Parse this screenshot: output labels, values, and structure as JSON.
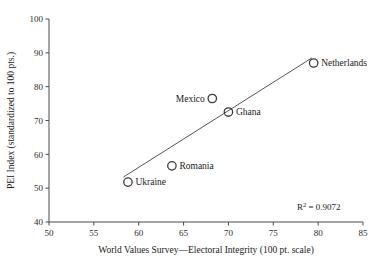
{
  "chart_data": {
    "type": "scatter",
    "title": "",
    "xlabel": "World Values Survey—Electoral Integrity (100 pt. scale)",
    "ylabel": "PEI Index (standardized to 100 pts.)",
    "xlim": [
      50,
      85
    ],
    "ylim": [
      40,
      100
    ],
    "xticks": [
      50,
      55,
      60,
      65,
      70,
      75,
      80,
      85
    ],
    "yticks": [
      40,
      50,
      60,
      70,
      80,
      90,
      100
    ],
    "xtick_labels": [
      "50",
      "55",
      "60",
      "65",
      "70",
      "75",
      "80",
      "85"
    ],
    "ytick_labels": [
      "40",
      "50",
      "60",
      "70",
      "80",
      "90",
      "100"
    ],
    "grid": false,
    "legend": "none",
    "marker_style": "open-circle",
    "points": [
      {
        "label": "Ukraine",
        "x": 58.8,
        "y": 51.8,
        "label_side": "right"
      },
      {
        "label": "Romania",
        "x": 63.7,
        "y": 56.6,
        "label_side": "right"
      },
      {
        "label": "Mexico",
        "x": 68.2,
        "y": 76.5,
        "label_side": "left"
      },
      {
        "label": "Ghana",
        "x": 70.0,
        "y": 72.5,
        "label_side": "right"
      },
      {
        "label": "Netherlands",
        "x": 79.5,
        "y": 87.0,
        "label_side": "right"
      }
    ],
    "trendline": {
      "x0": 58.3,
      "y0": 53.3,
      "x1": 79.3,
      "y1": 88.5
    },
    "annotations": [
      {
        "name": "r-squared",
        "prefix": "R",
        "superscript": "2",
        "text": " = 0.9072",
        "x": 82.5,
        "y": 43.5
      }
    ],
    "colors": {
      "background": "#ffffff",
      "axis": "#4a4a4a",
      "marker": "#3a3a3a",
      "trendline": "#555555",
      "text": "#1a1a1a"
    }
  }
}
